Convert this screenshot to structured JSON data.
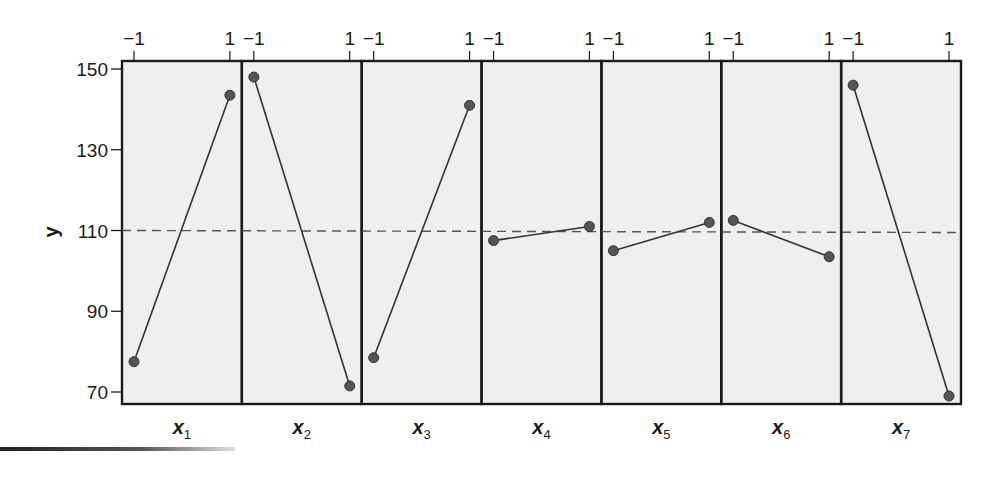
{
  "chart_data": {
    "type": "line",
    "title": "",
    "subtitle": "Main effects plot",
    "ylabel": "y",
    "xlabel": "",
    "ylim": [
      67,
      152
    ],
    "yticks": [
      70,
      90,
      110,
      130,
      150
    ],
    "grand_mean": 110,
    "grand_mean_style": "dashed",
    "level_labels": [
      "-1",
      "1"
    ],
    "panel_background": "#efefef",
    "line_color": "#333333",
    "marker_color": "#555555",
    "series": [
      {
        "name": "x1",
        "label": "x",
        "sub": "1",
        "values": [
          77.5,
          143.5
        ]
      },
      {
        "name": "x2",
        "label": "x",
        "sub": "2",
        "values": [
          148.0,
          71.5
        ]
      },
      {
        "name": "x3",
        "label": "x",
        "sub": "3",
        "values": [
          78.5,
          141.0
        ]
      },
      {
        "name": "x4",
        "label": "x",
        "sub": "4",
        "values": [
          107.5,
          111.0
        ]
      },
      {
        "name": "x5",
        "label": "x",
        "sub": "5",
        "values": [
          105.0,
          112.0
        ]
      },
      {
        "name": "x6",
        "label": "x",
        "sub": "6",
        "values": [
          112.5,
          103.5
        ]
      },
      {
        "name": "x7",
        "label": "x",
        "sub": "7",
        "values": [
          146.0,
          69.0
        ]
      }
    ],
    "grid": false,
    "legend": "none"
  }
}
